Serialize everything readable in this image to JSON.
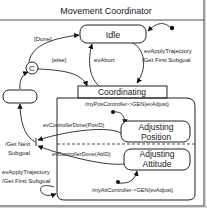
{
  "frame": {
    "title": "Movement Coordinator"
  },
  "states": {
    "idle": "Idle",
    "coordinating": "Coordinating",
    "adjusting_position": [
      "Adjusting",
      "Position"
    ],
    "adjusting_attitude": [
      "Adjusting",
      "Attitude"
    ],
    "unnamed_left": "",
    "choice": "C"
  },
  "transitions": {
    "done_guard": "[Done]",
    "else_guard": "[else]",
    "ev_abort": "evAbort",
    "apply_top": [
      "evApplyTrajectory",
      "/Get First Subgoal"
    ],
    "pos_entry_action": "/myPosController->GEN(evAdjust)",
    "pos_done": "evControllerDone(PosID)",
    "att_done": "evControllerDone(AttID)",
    "att_entry_action": "/myAttController->GEN(evAdjust)",
    "get_next": [
      "/Get Next",
      "Subgoal"
    ],
    "apply_bottom": [
      "evApplyTrajectory",
      "/Get First Subgoal"
    ]
  },
  "colors": {
    "line": "#222222",
    "frame": "#555555",
    "background": "#ffffff"
  }
}
